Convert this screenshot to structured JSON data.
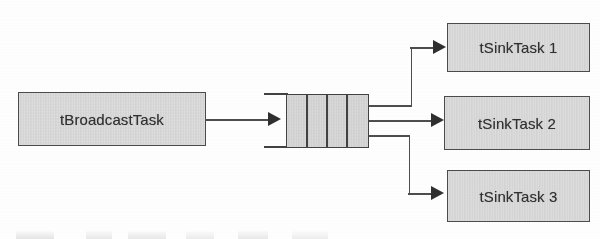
{
  "diagram": {
    "type": "dataflow-block-diagram",
    "background_color": "#ffffff",
    "node_fill_color": "#d2d2d2",
    "node_border_color": "#4a4a4a",
    "connector_color": "#4c4c4c",
    "nodes": {
      "source": {
        "id": "broadcast-task",
        "label": "tBroadcastTask",
        "shape": "rectangle",
        "x": 18,
        "y": 92,
        "width": 188,
        "height": 54
      },
      "queue": {
        "id": "message-queue",
        "label": "",
        "shape": "queue",
        "cells": 4,
        "x": 286,
        "y": 94,
        "width": 83,
        "height": 54
      },
      "sinks": [
        {
          "id": "sink-task-1",
          "label": "tSinkTask 1",
          "shape": "rectangle",
          "x": 447,
          "y": 23,
          "width": 143,
          "height": 49
        },
        {
          "id": "sink-task-2",
          "label": "tSinkTask 2",
          "shape": "rectangle",
          "x": 444,
          "y": 96,
          "width": 146,
          "height": 54
        },
        {
          "id": "sink-task-3",
          "label": "tSinkTask 3",
          "shape": "rectangle",
          "x": 447,
          "y": 170,
          "width": 143,
          "height": 52
        }
      ]
    },
    "connectors": [
      {
        "id": "broadcast-to-queue",
        "from": "broadcast-task",
        "to": "message-queue",
        "style": "straight-arrow"
      },
      {
        "id": "queue-to-sink-1",
        "from": "message-queue",
        "to": "sink-task-1",
        "style": "orthogonal-arrow"
      },
      {
        "id": "queue-to-sink-2",
        "from": "message-queue",
        "to": "sink-task-2",
        "style": "straight-arrow"
      },
      {
        "id": "queue-to-sink-3",
        "from": "message-queue",
        "to": "sink-task-3",
        "style": "orthogonal-arrow"
      }
    ]
  }
}
